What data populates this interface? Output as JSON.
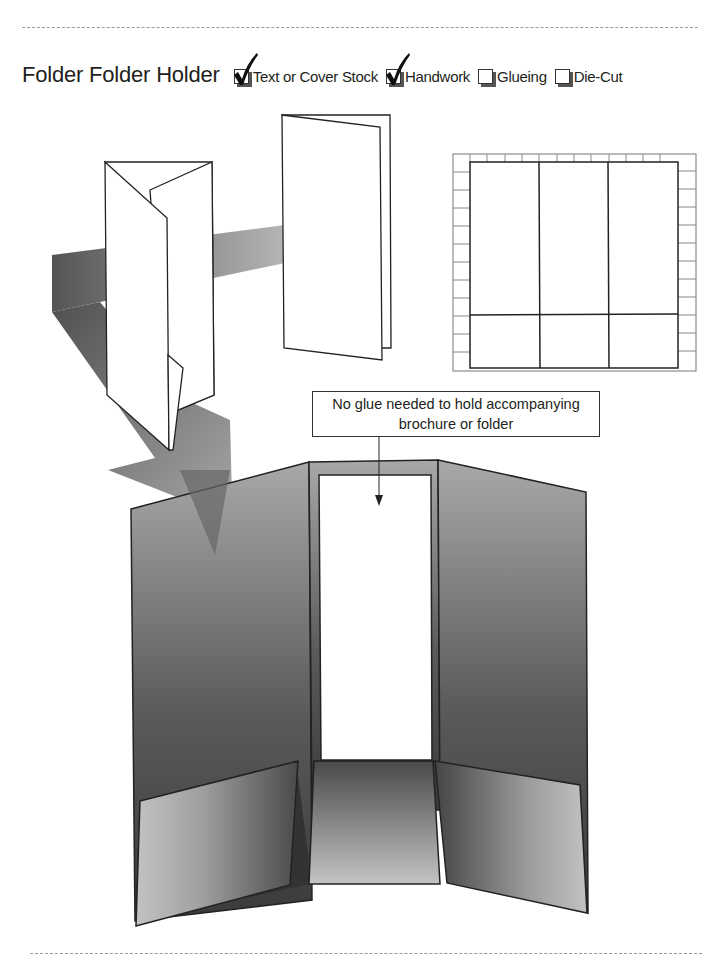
{
  "header": {
    "title": "Folder Folder Holder",
    "options": [
      {
        "label": "Text or Cover Stock",
        "checked": true,
        "icon": "checkmark-icon"
      },
      {
        "label": "Handwork",
        "checked": true,
        "icon": "checkmark-icon"
      },
      {
        "label": "Glueing",
        "checked": false,
        "icon": "empty-checkbox-icon"
      },
      {
        "label": "Die-Cut",
        "checked": false,
        "icon": "empty-checkbox-icon"
      }
    ]
  },
  "illustration": {
    "callout": {
      "line1": "No glue needed to hold accompanying",
      "line2": "brochure or folder"
    },
    "parts": [
      "tri-fold-brochure",
      "bi-fold-brochure",
      "die-line-template",
      "folder-holder-open"
    ]
  },
  "colors": {
    "ink": "#231f20",
    "folder_dark": "#4a4a4a",
    "folder_light": "#bdbdbd",
    "shadow_arrow": "#8a8a8a",
    "dash_rule": "#9a9a9a"
  }
}
